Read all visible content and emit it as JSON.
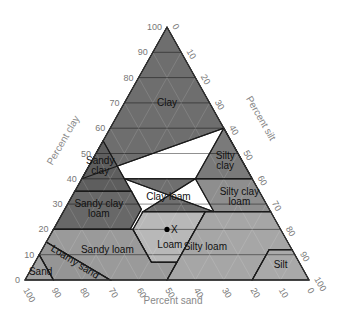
{
  "diagram": {
    "type": "soil-texture-triangle",
    "axes": {
      "clay_label": "Percent clay",
      "silt_label": "Percent silt",
      "sand_label": "Percent sand",
      "clay_ticks": [
        "0",
        "10",
        "20",
        "30",
        "40",
        "50",
        "60",
        "70",
        "80",
        "90",
        "100"
      ],
      "silt_ticks": [
        "0",
        "10",
        "20",
        "30",
        "40",
        "50",
        "60",
        "70",
        "80",
        "90",
        "100"
      ],
      "sand_ticks": [
        "100",
        "90",
        "80",
        "70",
        "60",
        "50",
        "40",
        "30",
        "20",
        "10",
        "0"
      ]
    },
    "regions": [
      {
        "name": "Clay",
        "label": "Clay",
        "color": "#6e6e6e",
        "pts": [
          [
            40,
            60,
            0
          ],
          [
            45,
            55,
            0
          ],
          [
            100,
            0,
            0
          ],
          [
            40,
            0,
            60
          ],
          [
            60,
            0,
            40
          ]
        ],
        "lx": [
          0,
          0
        ],
        "lines": [
          "Clay"
        ],
        "at": [
          70,
          15
        ]
      },
      {
        "name": "Sandy clay",
        "label": "Sandy clay",
        "color": "#5e5e5e",
        "pts": [
          [
            35,
            45,
            20
          ],
          [
            35,
            65,
            0
          ],
          [
            55,
            45,
            0
          ]
        ],
        "lines": [
          "Sandy",
          "clay"
        ],
        "at": [
          45,
          51
        ]
      },
      {
        "name": "Silty clay",
        "label": "Silty clay",
        "color": "#7a7a7a",
        "pts": [
          [
            40,
            0,
            60
          ],
          [
            60,
            0,
            40
          ],
          [
            40,
            20,
            40
          ]
        ],
        "lines": [
          "Silty",
          "clay"
        ],
        "at": [
          47,
          6
        ]
      },
      {
        "name": "Sandy clay loam",
        "label": "Sandy clay loam",
        "color": "#686868",
        "pts": [
          [
            20,
            80,
            0
          ],
          [
            35,
            65,
            0
          ],
          [
            35,
            45,
            20
          ],
          [
            28,
            45,
            27
          ],
          [
            20,
            53,
            27
          ]
        ],
        "lines": [
          "Sandy clay",
          "loam"
        ],
        "at": [
          28,
          60
        ]
      },
      {
        "name": "Clay loam",
        "label": "Clay loam",
        "color": "#6f6f6f",
        "pts": [
          [
            27,
            45,
            28
          ],
          [
            40,
            20,
            40
          ],
          [
            40,
            45,
            15
          ],
          [
            27,
            20,
            53
          ]
        ],
        "lines": [
          "Clay loam"
        ],
        "at": [
          33,
          33
        ]
      },
      {
        "name": "Silty clay loam",
        "label": "Silty clay loam",
        "color": "#8e8e8e",
        "pts": [
          [
            27,
            0,
            73
          ],
          [
            40,
            0,
            60
          ],
          [
            40,
            20,
            40
          ],
          [
            27,
            20,
            53
          ]
        ],
        "lines": [
          "Silty clay",
          "loam"
        ],
        "at": [
          33,
          8
        ]
      },
      {
        "name": "Loam",
        "label": "Loam",
        "color": "#b8b8b8",
        "pts": [
          [
            7,
            52,
            41
          ],
          [
            20,
            52,
            28
          ],
          [
            27,
            45,
            28
          ],
          [
            27,
            23,
            50
          ],
          [
            7,
            43,
            50
          ]
        ],
        "lines": [
          "Loam"
        ],
        "at": [
          14,
          42
        ]
      },
      {
        "name": "Sandy loam",
        "label": "Sandy loam",
        "color": "#9a9a9a",
        "pts": [
          [
            0,
            70,
            30
          ],
          [
            15,
            85,
            0
          ],
          [
            20,
            80,
            0
          ],
          [
            20,
            52,
            28
          ],
          [
            7,
            52,
            41
          ],
          [
            7,
            43,
            50
          ],
          [
            0,
            50,
            50
          ]
        ],
        "lines": [
          "Sandy loam"
        ],
        "at": [
          12,
          65
        ]
      },
      {
        "name": "Loamy sand",
        "label": "Loamy sand",
        "color": "#959595",
        "pts": [
          [
            0,
            90,
            10
          ],
          [
            10,
            90,
            0
          ],
          [
            15,
            85,
            0
          ],
          [
            0,
            70,
            30
          ]
        ],
        "lines": [
          "Loamy sand"
        ],
        "at": [
          6,
          80
        ]
      },
      {
        "name": "Sand",
        "label": "Sand",
        "color": "#a0a0a0",
        "pts": [
          [
            0,
            100,
            0
          ],
          [
            10,
            90,
            0
          ],
          [
            0,
            90,
            10
          ]
        ],
        "lines": [
          "Sand"
        ],
        "at": [
          3,
          93
        ]
      },
      {
        "name": "Silt loam",
        "label": "Silty loam",
        "color": "#a6a6a6",
        "pts": [
          [
            0,
            50,
            50
          ],
          [
            27,
            23,
            50
          ],
          [
            27,
            0,
            73
          ],
          [
            12,
            0,
            88
          ],
          [
            12,
            8,
            80
          ],
          [
            0,
            20,
            80
          ]
        ],
        "lines": [
          "Silty loam"
        ],
        "at": [
          13,
          30
        ]
      },
      {
        "name": "Silt",
        "label": "Silt",
        "color": "#a9a9a9",
        "pts": [
          [
            0,
            20,
            80
          ],
          [
            12,
            8,
            80
          ],
          [
            12,
            0,
            88
          ],
          [
            0,
            0,
            100
          ]
        ],
        "lines": [
          "Silt"
        ],
        "at": [
          6,
          7
        ]
      }
    ],
    "sample_point": {
      "label": "X",
      "clay": 20,
      "sand": 40,
      "silt": 40
    }
  }
}
